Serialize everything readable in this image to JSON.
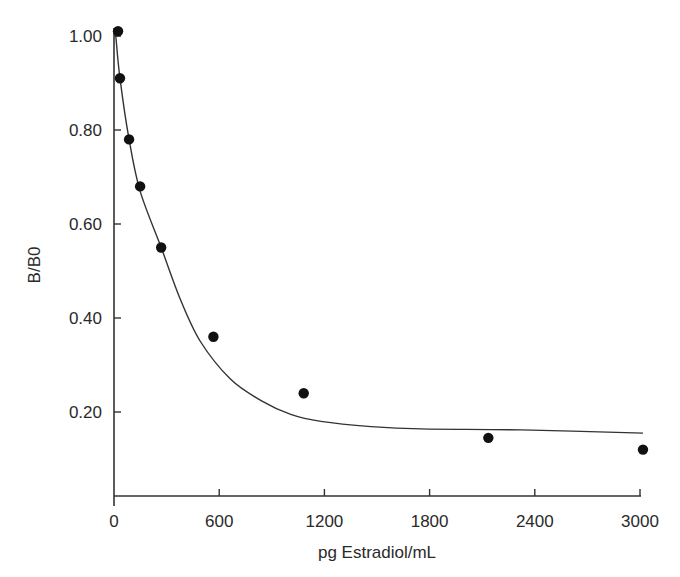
{
  "chart_data": {
    "type": "scatter",
    "title": "",
    "xlabel": "pg Estradiol/mL",
    "ylabel": "B/B0",
    "xlim": [
      0,
      3000
    ],
    "ylim": [
      0.02,
      1.0
    ],
    "x_ticks": [
      0,
      600,
      1200,
      1800,
      2400,
      3000
    ],
    "x_tick_labels": [
      "0",
      "600",
      "1200",
      "1800",
      "2400",
      "3000"
    ],
    "y_ticks": [
      0.2,
      0.4,
      0.6,
      0.8,
      1.0
    ],
    "y_tick_labels": [
      "0.20",
      "0.40",
      "0.60",
      "0.80",
      "1.00"
    ],
    "grid": false,
    "legend": null,
    "series": [
      {
        "name": "measured",
        "kind": "scatter",
        "marker": "filled-circle",
        "color": "#111111",
        "x": [
          23,
          34,
          86,
          149,
          269,
          567,
          1082,
          2135,
          3017
        ],
        "y": [
          1.01,
          0.91,
          0.78,
          0.68,
          0.55,
          0.36,
          0.24,
          0.145,
          0.12
        ]
      },
      {
        "name": "fitted curve",
        "kind": "line",
        "color": "#333333",
        "x": [
          10,
          34,
          86,
          149,
          269,
          378,
          493,
          664,
          836,
          1008,
          1180,
          1466,
          1752,
          2324,
          3017
        ],
        "y": [
          1.0,
          0.91,
          0.78,
          0.67,
          0.55,
          0.44,
          0.35,
          0.27,
          0.225,
          0.195,
          0.18,
          0.169,
          0.164,
          0.162,
          0.155
        ]
      }
    ]
  }
}
